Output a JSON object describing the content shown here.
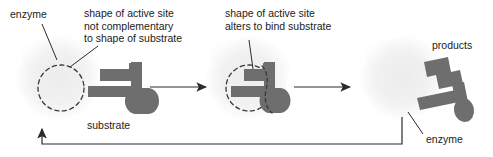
{
  "diagram": {
    "type": "process-flow",
    "background_color": "#ffffff",
    "enzyme_body_color": "#f2f2f2",
    "substrate_color": "#6e6e6e",
    "active_site_outline_color": "#3a3a3a",
    "text_color": "#1a1a1a",
    "arrow_color": "#2b2b2b"
  },
  "labels": {
    "enzyme_left": "enzyme",
    "active_site_not_complementary": "shape of active site\nnot complementary\nto shape of substrate",
    "active_site_not_complementary_lines": [
      "shape of active site",
      "not complementary",
      "to shape of substrate"
    ],
    "active_site_alters": "shape of active site\nalters to bind substrate",
    "active_site_alters_lines": [
      "shape of active site",
      "alters to bind substrate"
    ],
    "substrate": "substrate",
    "products": "products",
    "enzyme_right": "enzyme"
  },
  "stages": [
    {
      "name": "stage-1-free-enzyme-and-substrate",
      "enzyme_present": true,
      "active_site_shape": "circle-dashed",
      "substrate_bound": false,
      "caption": "substrate"
    },
    {
      "name": "stage-2-enzyme-substrate-complex",
      "enzyme_present": true,
      "active_site_shape": "circle-dashed-deformed",
      "substrate_bound": true,
      "caption": "shape of active site alters to bind substrate"
    },
    {
      "name": "stage-3-products-released",
      "enzyme_present": true,
      "active_site_shape": "circle-restored",
      "substrate_bound": false,
      "caption": "products"
    }
  ],
  "arrows": [
    {
      "name": "reaction-arrow-1",
      "direction": "right"
    },
    {
      "name": "reaction-arrow-2",
      "direction": "right"
    },
    {
      "name": "enzyme-recycle-arrow",
      "direction": "left-then-up"
    }
  ]
}
